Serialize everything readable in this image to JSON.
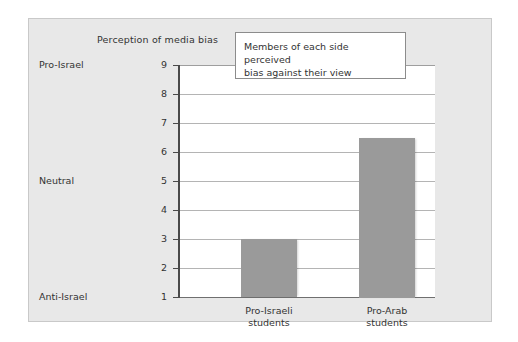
{
  "chart_data": {
    "type": "bar",
    "title": "Perception of media bias",
    "xlabel": "",
    "ylabel": "",
    "categories": [
      "Pro-Israeli students",
      "Pro-Arab students"
    ],
    "category_lines": [
      [
        "Pro-Israeli",
        "students"
      ],
      [
        "Pro-Arab",
        "students"
      ]
    ],
    "values": [
      3,
      6.5
    ],
    "ylim": [
      1,
      9
    ],
    "yticks": [
      1,
      2,
      3,
      4,
      5,
      6,
      7,
      8,
      9
    ],
    "ytick_labels": [
      "1",
      "2",
      "3",
      "4",
      "5",
      "6",
      "7",
      "8",
      "9"
    ],
    "y_category_labels": [
      {
        "value": 9,
        "label": "Pro-Israel"
      },
      {
        "value": 5,
        "label": "Neutral"
      },
      {
        "value": 1,
        "label": "Anti-Israel"
      }
    ],
    "grid": true,
    "legend": false,
    "bar_color": "#9a9a9a",
    "plot_background": "#ffffff",
    "card_background": "#e8e8e8",
    "annotations": [
      {
        "id": "callout",
        "lines": [
          "Members of each side perceived",
          "bias against their view"
        ],
        "text": "Members of each side perceived bias against their view"
      }
    ]
  }
}
